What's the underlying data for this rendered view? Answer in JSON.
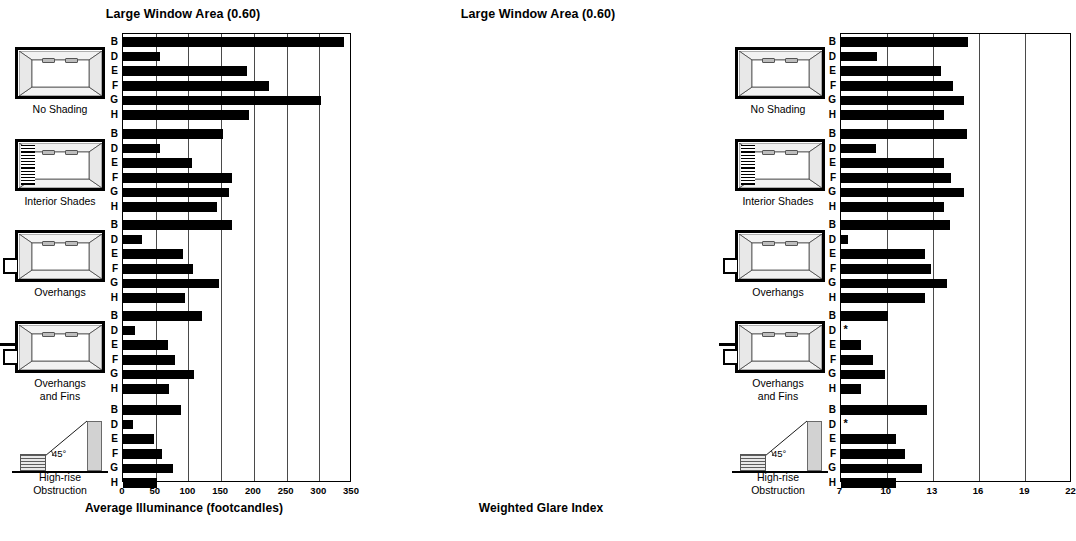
{
  "chart_data": [
    {
      "type": "bar",
      "orientation": "horizontal",
      "title": "Large Window Area (0.60)",
      "xlabel": "Average Illuminance (footcandles)",
      "ylabel": "",
      "xlim": [
        0,
        350
      ],
      "xticks": [
        0,
        50,
        100,
        150,
        200,
        250,
        300,
        350
      ],
      "grid": true,
      "legend": "none",
      "categories": [
        "B",
        "D",
        "E",
        "F",
        "G",
        "H"
      ],
      "groups": [
        {
          "name": "No Shading",
          "values": [
            338,
            57,
            189,
            223,
            303,
            193
          ]
        },
        {
          "name": "Interior Shades",
          "values": [
            153,
            57,
            106,
            166,
            162,
            143
          ]
        },
        {
          "name": "Overhangs",
          "values": [
            166,
            29,
            91,
            107,
            146,
            94
          ]
        },
        {
          "name": "Overhangs and Fins",
          "values": [
            121,
            18,
            69,
            80,
            109,
            71
          ]
        },
        {
          "name": "High-rise Obstruction",
          "values": [
            89,
            15,
            47,
            59,
            77,
            52
          ]
        }
      ]
    },
    {
      "type": "bar",
      "orientation": "horizontal",
      "title": "Large Window Area (0.60)",
      "xlabel": "Weighted Glare Index",
      "ylabel": "",
      "xlim": [
        7,
        22
      ],
      "xticks": [
        7,
        10,
        13,
        16,
        19,
        22
      ],
      "grid": true,
      "legend": "none",
      "categories": [
        "B",
        "D",
        "E",
        "F",
        "G",
        "H"
      ],
      "groups": [
        {
          "name": "No Shading",
          "values": [
            15.3,
            9.4,
            13.5,
            14.3,
            15.0,
            13.7
          ],
          "notes": []
        },
        {
          "name": "Interior Shades",
          "values": [
            15.2,
            9.3,
            13.7,
            14.2,
            15.0,
            13.7
          ],
          "notes": []
        },
        {
          "name": "Overhangs",
          "values": [
            14.1,
            7.5,
            12.5,
            12.9,
            13.9,
            12.5
          ],
          "notes": []
        },
        {
          "name": "Overhangs and Fins",
          "values": [
            10.1,
            null,
            8.3,
            9.1,
            9.9,
            8.3
          ],
          "notes": [
            {
              "category": "D",
              "marker": "*"
            }
          ]
        },
        {
          "name": "High-rise Obstruction",
          "values": [
            12.6,
            null,
            10.6,
            11.2,
            12.3,
            10.6
          ],
          "notes": [
            {
              "category": "D",
              "marker": "*"
            }
          ]
        }
      ]
    }
  ],
  "left_panel": {
    "title": "Large Window Area (0.60)",
    "axis_label": "Average Illuminance (footcandles)",
    "ticks": [
      "0",
      "50",
      "100",
      "150",
      "200",
      "250",
      "300",
      "350"
    ],
    "groups": [
      {
        "label": "No Shading",
        "icon": "room-plan-no-shading"
      },
      {
        "label": "Interior Shades",
        "icon": "room-plan-interior-shades"
      },
      {
        "label": "Overhangs",
        "icon": "room-plan-overhangs"
      },
      {
        "label_line1": "Overhangs",
        "label_line2": "and Fins",
        "icon": "room-plan-overhangs-fins"
      },
      {
        "label_line1": "High-rise",
        "label_line2": "Obstruction",
        "icon": "high-rise-obstruction",
        "angle": "45°"
      }
    ]
  },
  "right_panel": {
    "title": "Large Window Area (0.60)",
    "axis_label": "Weighted Glare Index",
    "ticks": [
      "7",
      "10",
      "13",
      "16",
      "19",
      "22"
    ],
    "groups": [
      {
        "label": "No Shading",
        "icon": "room-plan-no-shading"
      },
      {
        "label": "Interior Shades",
        "icon": "room-plan-interior-shades"
      },
      {
        "label": "Overhangs",
        "icon": "room-plan-overhangs"
      },
      {
        "label_line1": "Overhangs",
        "label_line2": "and Fins",
        "icon": "room-plan-overhangs-fins"
      },
      {
        "label_line1": "High-rise",
        "label_line2": "Obstruction",
        "icon": "high-rise-obstruction",
        "angle": "45°"
      }
    ],
    "missing_marker": "*"
  }
}
